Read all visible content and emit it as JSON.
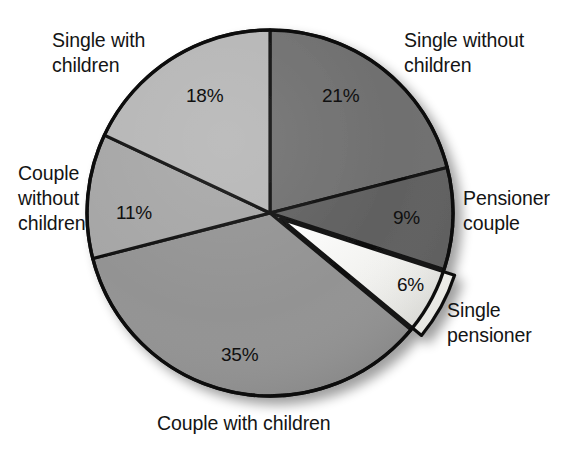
{
  "chart_data": {
    "type": "pie",
    "title": "",
    "subtitle": "",
    "xlabel": "",
    "ylabel": "",
    "legend_position": "none",
    "grid": false,
    "units": "percent",
    "total": 100,
    "start_angle_deg": 0,
    "direction": "clockwise",
    "categories": [
      "Single without children",
      "Pensioner couple",
      "Single pensioner",
      "Couple with children",
      "Couple without children",
      "Single with children"
    ],
    "values": [
      21,
      9,
      6,
      35,
      11,
      18
    ],
    "slices": [
      {
        "label": "Single without children",
        "value": 21,
        "value_text": "21%",
        "color": "#6f6f6f",
        "exploded": false
      },
      {
        "label": "Pensioner couple",
        "value": 9,
        "value_text": "9%",
        "color": "#606060",
        "exploded": false
      },
      {
        "label": "Single pensioner",
        "value": 6,
        "value_text": "6%",
        "color": "#eeeeea",
        "exploded": true
      },
      {
        "label": "Couple with children",
        "value": 35,
        "value_text": "35%",
        "color": "#939393",
        "exploded": false
      },
      {
        "label": "Couple without children",
        "value": 11,
        "value_text": "11%",
        "color": "#a6a6a6",
        "exploded": false
      },
      {
        "label": "Single with children",
        "value": 18,
        "value_text": "18%",
        "color": "#b6b6b6",
        "exploded": false
      }
    ]
  },
  "labels": {
    "single_with_children": "Single with\nchildren",
    "single_without_children": "Single without\nchildren",
    "couple_without_children": "Couple\nwithout\nchildren",
    "pensioner_couple": "Pensioner\ncouple",
    "single_pensioner": "Single\npensioner",
    "couple_with_children": "Couple with children"
  },
  "percent_labels": {
    "single_without_children": "21%",
    "pensioner_couple": "9%",
    "single_pensioner": "6%",
    "couple_with_children": "35%",
    "couple_without_children": "11%",
    "single_with_children": "18%"
  },
  "style": {
    "background": "#ffffff",
    "outline": "#101010",
    "text": "#141414"
  }
}
